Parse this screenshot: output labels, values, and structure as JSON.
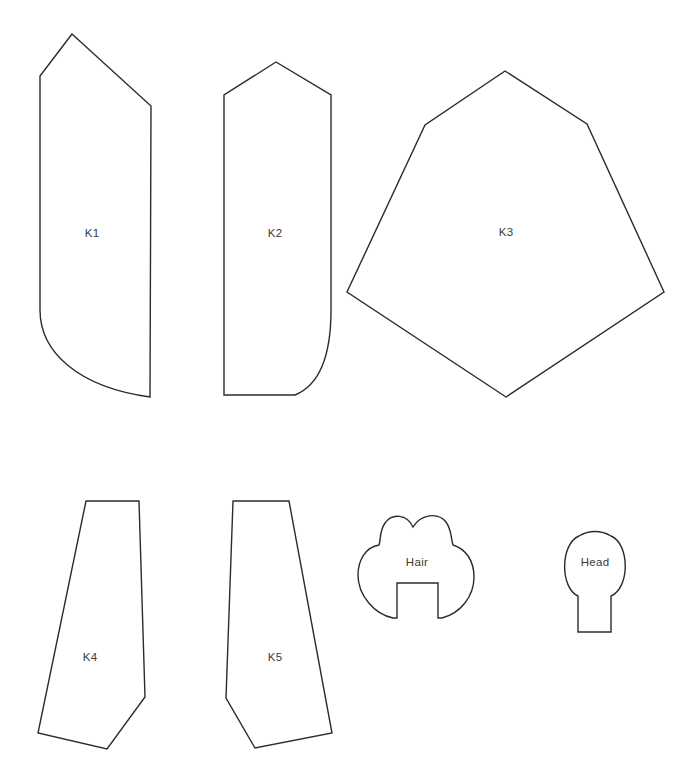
{
  "document": {
    "kind": "sewing-pattern-sheet",
    "background_color": "#ffffff",
    "stroke_color": "#2b2b2b",
    "label_color": "#3a3a3a",
    "fill_color": "#ffffff",
    "width": 683,
    "height": 779
  },
  "pieces": [
    {
      "id": "k1",
      "label": "K1",
      "label_x": 92,
      "label_y": 234,
      "path": "M 72 34 L 40 76 L 40 310 C 40 352 78 387 150 397 L 151 106 Z",
      "description": "tall panel, pointed top, curved lower-left corner"
    },
    {
      "id": "k2",
      "label": "K2",
      "label_x": 275,
      "label_y": 234,
      "path": "M 276 62 L 224 95 L 224 395 L 295 395 C 322 384 331 352 331 310 L 331 95 Z",
      "description": "tall panel, pointed top, curved lower-right corner"
    },
    {
      "id": "k3",
      "label": "K3",
      "label_x": 506,
      "label_y": 233,
      "path": "M 505 71 L 425 125 L 347 292 L 506 397 L 664 292 L 587 124 Z",
      "description": "large hexagonal body panel"
    },
    {
      "id": "k4",
      "label": "K4",
      "label_x": 90,
      "label_y": 658,
      "path": "M 86 501 L 139 501 L 145 697 L 107 749 L 38 733 Z",
      "description": "tapered leg panel, angled lower-right"
    },
    {
      "id": "k5",
      "label": "K5",
      "label_x": 275,
      "label_y": 658,
      "path": "M 233 501 L 289 501 L 332 733 L 255 748 L 226 698 Z",
      "description": "tapered leg panel, angled lower-left"
    },
    {
      "id": "hair",
      "label": "Hair",
      "label_x": 417,
      "label_y": 563,
      "path": "M 413 527 C 407 514 392 513 385 523 C 379 532 381 540 379 545 C 366 547 358 560 358 575 C 358 595 374 614 393 618 L 397 618 L 397 583 L 438 583 L 438 618 L 442 618 C 461 613 474 596 474 577 C 474 561 466 549 453 545 C 451 540 452 530 446 522 C 438 512 421 514 413 527 Z",
      "description": "hairpiece with two crown bumps and rectangular face notch"
    },
    {
      "id": "head",
      "label": "Head",
      "label_x": 595,
      "label_y": 563,
      "path": "M 578 596 L 578 632 L 611 632 L 611 596 C 630 588 630 544 611 536 C 601 530 589 530 579 536 C 560 544 560 588 578 596 Z",
      "circle": {
        "cx": 595,
        "cy": 566,
        "r": 35
      },
      "neck": {
        "x": 578,
        "y": 566,
        "width": 33,
        "height": 66
      },
      "description": "head circle with neck tab"
    }
  ]
}
